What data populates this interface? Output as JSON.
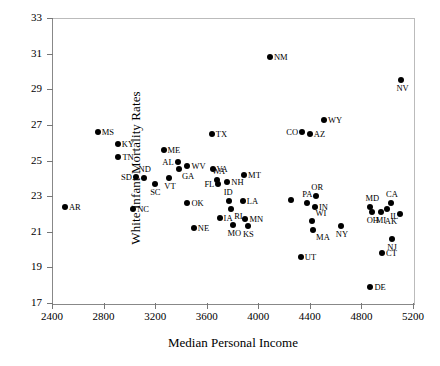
{
  "chart_data": {
    "type": "scatter",
    "title": "",
    "xlabel": "Median Personal Income",
    "ylabel": "White Infant Mortality Rates",
    "xlim": [
      2400,
      5200
    ],
    "ylim": [
      17,
      33
    ],
    "xticks": [
      2400,
      2800,
      3200,
      3600,
      4000,
      4400,
      4800,
      5200
    ],
    "yticks": [
      17,
      19,
      21,
      23,
      25,
      27,
      29,
      31,
      33
    ],
    "grid": false,
    "legend": null,
    "point_label_field": "state",
    "points": [
      {
        "state": "AR",
        "x": 2500,
        "y": 22.4,
        "lpos": "r"
      },
      {
        "state": "MS",
        "x": 2755,
        "y": 26.6,
        "lpos": "r"
      },
      {
        "state": "KY",
        "x": 2910,
        "y": 25.9,
        "lpos": "r"
      },
      {
        "state": "TN",
        "x": 2915,
        "y": 25.2,
        "lpos": "r"
      },
      {
        "state": "NC",
        "x": 3030,
        "y": 22.3,
        "lpos": "r"
      },
      {
        "state": "SD",
        "x": 3050,
        "y": 24.1,
        "lpos": "l"
      },
      {
        "state": "ND",
        "x": 3110,
        "y": 24.0,
        "lpos": "t"
      },
      {
        "state": "SC",
        "x": 3200,
        "y": 23.7,
        "lpos": "b"
      },
      {
        "state": "ME",
        "x": 3265,
        "y": 25.6,
        "lpos": "r"
      },
      {
        "state": "VT",
        "x": 3310,
        "y": 24.0,
        "lpos": "b"
      },
      {
        "state": "AL",
        "x": 3375,
        "y": 24.9,
        "lpos": "l"
      },
      {
        "state": "GA",
        "x": 3385,
        "y": 24.5,
        "lpos": "br"
      },
      {
        "state": "OK",
        "x": 3450,
        "y": 22.6,
        "lpos": "r"
      },
      {
        "state": "WV",
        "x": 3450,
        "y": 24.7,
        "lpos": "r"
      },
      {
        "state": "NE",
        "x": 3500,
        "y": 21.2,
        "lpos": "r"
      },
      {
        "state": "TX",
        "x": 3640,
        "y": 26.5,
        "lpos": "r"
      },
      {
        "state": "VA",
        "x": 3645,
        "y": 24.5,
        "lpos": "r"
      },
      {
        "state": "WA",
        "x": 3680,
        "y": 23.9,
        "lpos": "t"
      },
      {
        "state": "FL",
        "x": 3690,
        "y": 23.7,
        "lpos": "l"
      },
      {
        "state": "IA",
        "x": 3700,
        "y": 21.8,
        "lpos": "r"
      },
      {
        "state": "NH",
        "x": 3760,
        "y": 23.8,
        "lpos": "r"
      },
      {
        "state": "ID",
        "x": 3770,
        "y": 22.7,
        "lpos": "t"
      },
      {
        "state": "RI",
        "x": 3790,
        "y": 22.3,
        "lpos": "br"
      },
      {
        "state": "MO",
        "x": 3800,
        "y": 21.4,
        "lpos": "b"
      },
      {
        "state": "LA",
        "x": 3880,
        "y": 22.7,
        "lpos": "r"
      },
      {
        "state": "MT",
        "x": 3890,
        "y": 24.2,
        "lpos": "r"
      },
      {
        "state": "MN",
        "x": 3900,
        "y": 21.7,
        "lpos": "r"
      },
      {
        "state": "KS",
        "x": 3920,
        "y": 21.3,
        "lpos": "b"
      },
      {
        "state": "NM",
        "x": 4090,
        "y": 30.8,
        "lpos": "r"
      },
      {
        "state": "UT",
        "x": 4330,
        "y": 19.6,
        "lpos": "r"
      },
      {
        "state": "CO",
        "x": 4340,
        "y": 26.6,
        "lpos": "l"
      },
      {
        "state": "PA",
        "x": 4380,
        "y": 22.6,
        "lpos": "t"
      },
      {
        "state": "AZ",
        "x": 4400,
        "y": 26.5,
        "lpos": "r"
      },
      {
        "state": "WI",
        "x": 4420,
        "y": 21.6,
        "lpos": "tr"
      },
      {
        "state": "IN",
        "x": 4440,
        "y": 22.4,
        "lpos": "r"
      },
      {
        "state": "MA",
        "x": 4425,
        "y": 21.1,
        "lpos": "br"
      },
      {
        "state": "OR",
        "x": 4450,
        "y": 23.0,
        "lpos": "t"
      },
      {
        "state": "WY",
        "x": 4510,
        "y": 27.3,
        "lpos": "r"
      },
      {
        "state": "NY",
        "x": 4640,
        "y": 21.3,
        "lpos": "b"
      },
      {
        "state": "DE",
        "x": 4870,
        "y": 17.9,
        "lpos": "r"
      },
      {
        "state": "OH",
        "x": 4880,
        "y": 22.1,
        "lpos": "b"
      },
      {
        "state": "MD",
        "x": 4870,
        "y": 22.4,
        "lpos": "t"
      },
      {
        "state": "MI",
        "x": 4950,
        "y": 22.1,
        "lpos": "b"
      },
      {
        "state": "CT",
        "x": 4960,
        "y": 19.8,
        "lpos": "r"
      },
      {
        "state": "IL",
        "x": 5000,
        "y": 22.3,
        "lpos": "br"
      },
      {
        "state": "CA",
        "x": 5030,
        "y": 22.6,
        "lpos": "t"
      },
      {
        "state": "NJ",
        "x": 5040,
        "y": 20.6,
        "lpos": "b"
      },
      {
        "state": "AK",
        "x": 5100,
        "y": 22.0,
        "lpos": "bl"
      },
      {
        "state": "NV",
        "x": 5110,
        "y": 29.5,
        "lpos": "b"
      },
      {
        "state": "HI",
        "x": 4250,
        "y": 22.8,
        "lpos": "none"
      }
    ]
  },
  "axes": {
    "y_title": "White Infant Mortality Rates",
    "x_title": "Median Personal Income"
  }
}
